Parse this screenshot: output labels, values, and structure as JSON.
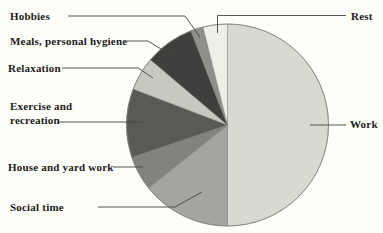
{
  "chart_data": {
    "type": "pie",
    "title": "",
    "xlabel": "",
    "ylabel": "",
    "legend_position": "none",
    "label_style": "callout-labels-with-leader-lines",
    "start_angle": "12-o-clock",
    "direction": "clockwise",
    "unit": "percent (estimated from slice angles; no numbers printed on chart)",
    "categories": [
      "Work",
      "Social time",
      "House and yard work",
      "Exercise and recreation",
      "Relaxation",
      "Meals, personal hygiene",
      "Hobbies",
      "Rest"
    ],
    "values": [
      50,
      14.3,
      5.5,
      11,
      5.4,
      7.9,
      2,
      3.9
    ],
    "colors": [
      "#d7dad0",
      "#a3a5a0",
      "#82837d",
      "#595a56",
      "#c7c9c0",
      "#3f403e",
      "#8e908b",
      "#eef0e8"
    ],
    "outline_color": "#83847b",
    "leader_line_color": "#45453f",
    "text_color": "#1c1c1a",
    "background_color": "#fdfdfa"
  }
}
